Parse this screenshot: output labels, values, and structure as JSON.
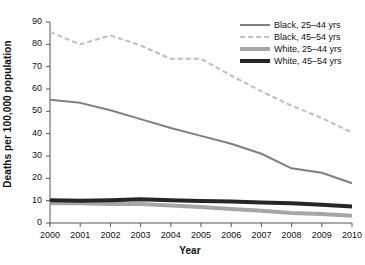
{
  "chart_data": {
    "type": "line",
    "title": "",
    "xlabel": "Year",
    "ylabel": "Deaths per 100,000 population",
    "x": [
      2000,
      2001,
      2002,
      2003,
      2004,
      2005,
      2006,
      2007,
      2008,
      2009,
      2010
    ],
    "categories": [
      "2000",
      "2001",
      "2002",
      "2003",
      "2004",
      "2005",
      "2006",
      "2007",
      "2008",
      "2009",
      "2010"
    ],
    "xlim": [
      2000,
      2010
    ],
    "ylim": [
      0,
      90
    ],
    "yticks": [
      0,
      10,
      20,
      30,
      40,
      50,
      60,
      70,
      80,
      90
    ],
    "ytick_labels": [
      "0",
      "10",
      "20",
      "30",
      "40",
      "50",
      "60",
      "70",
      "80",
      "90"
    ],
    "grid": false,
    "legend_position": "top-right",
    "series": [
      {
        "name": "Black, 25–44 yrs",
        "values": [
          55.2,
          53.8,
          50.5,
          46.5,
          42.5,
          39.0,
          35.5,
          31.0,
          24.5,
          22.5,
          17.8
        ],
        "color": "#808080",
        "style": "solid",
        "width": 2
      },
      {
        "name": "Black, 45–54 yrs",
        "values": [
          85.5,
          80.0,
          84.0,
          79.5,
          73.5,
          73.5,
          66.0,
          59.0,
          52.5,
          47.0,
          40.5
        ],
        "color": "#bfbfbf",
        "style": "dashed",
        "width": 2
      },
      {
        "name": "White, 25–44 yrs",
        "values": [
          8.8,
          8.8,
          8.5,
          8.5,
          7.8,
          7.2,
          6.3,
          5.5,
          4.5,
          4.0,
          3.2
        ],
        "color": "#a6a6a6",
        "style": "solid",
        "width": 4
      },
      {
        "name": "White, 45–54 yrs",
        "values": [
          10.2,
          10.0,
          10.2,
          10.6,
          10.2,
          9.8,
          9.6,
          9.2,
          8.8,
          8.2,
          7.4
        ],
        "color": "#262626",
        "style": "solid",
        "width": 4
      }
    ]
  },
  "legend": {
    "items": [
      {
        "label": "Black, 25–44 yrs"
      },
      {
        "label": "Black, 45–54 yrs"
      },
      {
        "label": "White, 25–44 yrs"
      },
      {
        "label": "White, 45–54 yrs"
      }
    ]
  },
  "axes": {
    "x_title": "Year",
    "y_title": "Deaths per 100,000 population"
  }
}
